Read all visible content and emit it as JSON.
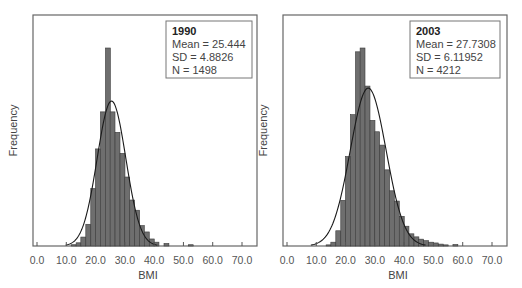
{
  "chart_data": [
    {
      "type": "bar",
      "subtype": "histogram_with_normal_curve",
      "title": "1990",
      "xlabel": "BMI",
      "ylabel": "Frequency",
      "xlim": [
        0,
        70
      ],
      "xticks": [
        "0.0",
        "10.0",
        "20.0",
        "30.0",
        "40.0",
        "50.0",
        "60.0",
        "70.0"
      ],
      "legend": {
        "position": "top-right",
        "title": "1990",
        "lines": [
          "Mean = 25.444",
          "SD = 4.8826",
          "N = 1498"
        ]
      },
      "stats": {
        "mean": 25.444,
        "sd": 4.8826,
        "n": 1498
      },
      "bin_width": 1.67,
      "bins": [
        {
          "x": 12.5,
          "freq": 2
        },
        {
          "x": 14.2,
          "freq": 5
        },
        {
          "x": 15.8,
          "freq": 14
        },
        {
          "x": 17.5,
          "freq": 34
        },
        {
          "x": 19.2,
          "freq": 90
        },
        {
          "x": 20.8,
          "freq": 152
        },
        {
          "x": 22.5,
          "freq": 210
        },
        {
          "x": 24.2,
          "freq": 310
        },
        {
          "x": 25.8,
          "freq": 210
        },
        {
          "x": 27.5,
          "freq": 178
        },
        {
          "x": 29.2,
          "freq": 145
        },
        {
          "x": 30.8,
          "freq": 108
        },
        {
          "x": 32.5,
          "freq": 72
        },
        {
          "x": 34.2,
          "freq": 56
        },
        {
          "x": 35.8,
          "freq": 32
        },
        {
          "x": 37.5,
          "freq": 22
        },
        {
          "x": 39.2,
          "freq": 11
        },
        {
          "x": 40.8,
          "freq": 6
        },
        {
          "x": 44.2,
          "freq": 4
        },
        {
          "x": 52.5,
          "freq": 2
        }
      ]
    },
    {
      "type": "bar",
      "subtype": "histogram_with_normal_curve",
      "title": "2003",
      "xlabel": "BMI",
      "ylabel": "Frequency",
      "xlim": [
        0,
        70
      ],
      "xticks": [
        "0.0",
        "10.0",
        "20.0",
        "30.0",
        "40.0",
        "50.0",
        "60.0",
        "70.0"
      ],
      "legend": {
        "position": "top-right",
        "title": "2003",
        "lines": [
          "Mean = 27.7308",
          "SD = 6.11952",
          "N = 4212"
        ]
      },
      "stats": {
        "mean": 27.7308,
        "sd": 6.11952,
        "n": 4212
      },
      "bin_width": 1.67,
      "bins": [
        {
          "x": 14.2,
          "freq": 3
        },
        {
          "x": 15.8,
          "freq": 10
        },
        {
          "x": 17.5,
          "freq": 40
        },
        {
          "x": 19.2,
          "freq": 120
        },
        {
          "x": 20.8,
          "freq": 235
        },
        {
          "x": 22.5,
          "freq": 345
        },
        {
          "x": 24.2,
          "freq": 510
        },
        {
          "x": 25.8,
          "freq": 520
        },
        {
          "x": 27.5,
          "freq": 420
        },
        {
          "x": 29.2,
          "freq": 330
        },
        {
          "x": 30.8,
          "freq": 300
        },
        {
          "x": 32.5,
          "freq": 265
        },
        {
          "x": 34.2,
          "freq": 200
        },
        {
          "x": 35.8,
          "freq": 145
        },
        {
          "x": 37.5,
          "freq": 118
        },
        {
          "x": 39.2,
          "freq": 78
        },
        {
          "x": 40.8,
          "freq": 52
        },
        {
          "x": 42.5,
          "freq": 32
        },
        {
          "x": 44.2,
          "freq": 24
        },
        {
          "x": 45.8,
          "freq": 18
        },
        {
          "x": 47.5,
          "freq": 14
        },
        {
          "x": 49.2,
          "freq": 10
        },
        {
          "x": 50.8,
          "freq": 8
        },
        {
          "x": 52.5,
          "freq": 5
        },
        {
          "x": 54.2,
          "freq": 3
        },
        {
          "x": 57.5,
          "freq": 4
        }
      ]
    }
  ]
}
